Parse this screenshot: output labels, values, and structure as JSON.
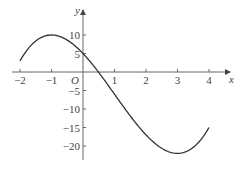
{
  "chart_data": {
    "type": "line",
    "title": "",
    "function": "y = x^3 - 3x^2 - 9x + 5",
    "xlabel": "x",
    "ylabel": "y",
    "origin_label": "O",
    "xlim": [
      -2,
      4
    ],
    "ylim": [
      -22,
      10
    ],
    "x_ticks": [
      -2,
      -1,
      1,
      2,
      3,
      4
    ],
    "x_tick_labels": [
      "−2",
      "−1",
      "1",
      "2",
      "3",
      "4"
    ],
    "y_ticks": [
      10,
      5,
      -5,
      -10,
      -15,
      -20
    ],
    "y_tick_labels": [
      "10",
      "5",
      "−5",
      "−10",
      "−15",
      "−20"
    ],
    "grid": false,
    "legend": null,
    "series": [
      {
        "name": "f(x)",
        "x": [
          -2,
          -1.5,
          -1,
          -0.5,
          0,
          0.5,
          1,
          1.5,
          2,
          2.5,
          3,
          3.5,
          4
        ],
        "values": [
          3,
          8.375,
          10,
          8.625,
          5,
          -0.125,
          -6,
          -11.875,
          -17,
          -20.625,
          -22,
          -20.375,
          -15
        ]
      }
    ],
    "key_points": {
      "local_max": {
        "x": -1,
        "y": 10
      },
      "local_min": {
        "x": 3,
        "y": -22
      },
      "y_intercept": {
        "x": 0,
        "y": 5
      }
    },
    "color": "#333333"
  }
}
